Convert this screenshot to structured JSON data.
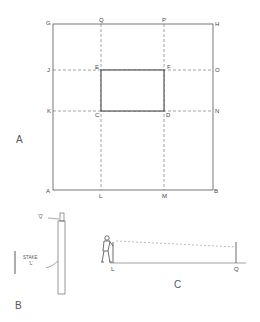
{
  "figure_a": {
    "caption": "A",
    "points": {
      "G": "G",
      "Q": "Q",
      "P": "P",
      "H": "H",
      "J": "J",
      "E": "E",
      "F": "F",
      "O": "O",
      "K": "K",
      "C": "C",
      "D": "D",
      "N": "N",
      "A": "A",
      "L": "L",
      "M": "M",
      "B": "B"
    }
  },
  "figure_b": {
    "caption": "B",
    "top_label": "'Q'",
    "stake_label_line1": "STAKE",
    "stake_label_line2": "'L'"
  },
  "figure_c": {
    "caption": "C",
    "left_point": "L",
    "right_point": "Q"
  }
}
